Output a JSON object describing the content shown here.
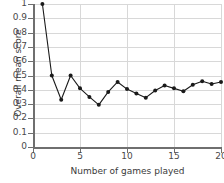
{
  "chart_data": {
    "type": "line",
    "title": "",
    "xlabel": "Number of games played",
    "ylabel": "Overall mean score",
    "xlim": [
      0,
      20
    ],
    "ylim": [
      0,
      1
    ],
    "grid": true,
    "legend": null,
    "marker": "filled-circle",
    "line_color": "#1a1a1a",
    "grid_color": "#d8d8d8",
    "axis_color": "#6f6f6f",
    "x_tick_labels": [
      "0",
      "5",
      "10",
      "15",
      "20"
    ],
    "x_ticks": [
      0,
      5,
      10,
      15,
      20
    ],
    "y_tick_labels": [
      "0",
      "0.1",
      "0.2",
      "0.3",
      "0.4",
      "0.5",
      "0.6",
      "0.7",
      "0.8",
      "0.9",
      "1"
    ],
    "y_ticks": [
      0,
      0.1,
      0.2,
      0.3,
      0.4,
      0.5,
      0.6,
      0.7,
      0.8,
      0.9,
      1
    ],
    "x": [
      1,
      2,
      3,
      4,
      5,
      6,
      7,
      8,
      9,
      10,
      11,
      12,
      13,
      14,
      15,
      16,
      17,
      18,
      19,
      20
    ],
    "values": [
      1.0,
      0.5,
      0.33,
      0.5,
      0.41,
      0.35,
      0.295,
      0.385,
      0.455,
      0.405,
      0.375,
      0.345,
      0.395,
      0.43,
      0.41,
      0.39,
      0.435,
      0.46,
      0.44,
      0.455
    ],
    "series": [
      {
        "name": "Overall mean score",
        "values": [
          1.0,
          0.5,
          0.33,
          0.5,
          0.41,
          0.35,
          0.295,
          0.385,
          0.455,
          0.405,
          0.375,
          0.345,
          0.395,
          0.43,
          0.41,
          0.39,
          0.435,
          0.46,
          0.44,
          0.455
        ]
      }
    ]
  }
}
